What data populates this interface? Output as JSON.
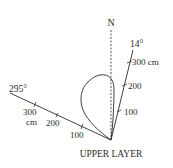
{
  "diagram": {
    "title": "UPPER LAYER",
    "north_label": "N",
    "axes": [
      {
        "name": "axis-14",
        "bearing_label": "14°",
        "ticks": [
          {
            "label": "100"
          },
          {
            "label": "200"
          },
          {
            "label": "300 cm"
          }
        ]
      },
      {
        "name": "axis-295",
        "bearing_label": "295°",
        "ticks": [
          {
            "label": "100"
          },
          {
            "label": "200"
          },
          {
            "label": "300"
          },
          {
            "label": "cm"
          }
        ]
      }
    ],
    "colors": {
      "line": "#2b2b2b",
      "background": "#ffffff"
    }
  }
}
